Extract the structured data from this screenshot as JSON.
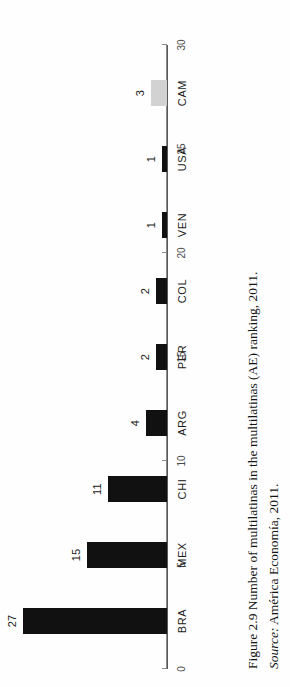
{
  "figure": {
    "caption_main": "Figure 2.9 Number of multilatinas in the multilatinas (AE) ranking, 2011.",
    "source_label": "Source:",
    "source_text": "América Economía, 2011."
  },
  "colors": {
    "bar": "#111111",
    "bar_accent": "#d2d2d2",
    "axis": "#8b8b8b",
    "text": "#1c1c1c",
    "page": "#fefefe"
  },
  "chart_data": {
    "type": "bar",
    "title": "Figure 2.9 Number of multilatinas in the multilatinas (AE) ranking, 2011.",
    "xlabel": "",
    "ylabel": "",
    "categories": [
      "BRA",
      "MEX",
      "CHI",
      "ARG",
      "PER",
      "COL",
      "VEN",
      "USA",
      "CAM"
    ],
    "values": [
      27,
      15,
      11,
      4,
      2,
      2,
      1,
      1,
      3
    ],
    "value_labels": [
      "27",
      "15",
      "11",
      "4",
      "2",
      "2",
      "1",
      "1",
      "3"
    ],
    "bar_colors": [
      "#111111",
      "#111111",
      "#111111",
      "#111111",
      "#111111",
      "#111111",
      "#111111",
      "#111111",
      "#d2d2d2"
    ],
    "ylim": [
      0,
      30
    ],
    "yticks": [
      0,
      5,
      10,
      15,
      20,
      25,
      30
    ],
    "ytick_labels": [
      "0",
      "5",
      "10",
      "15",
      "20",
      "25",
      "30"
    ],
    "grid": false,
    "legend": null,
    "orientation": "vertical-bars-page-rotated-90ccw"
  }
}
